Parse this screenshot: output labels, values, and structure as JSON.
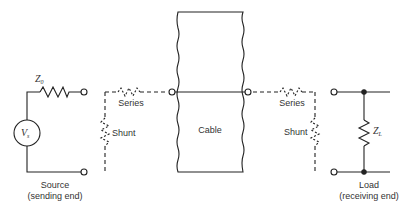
{
  "diagram": {
    "colors": {
      "line": "#222222",
      "text": "#333333",
      "background": "#ffffff"
    },
    "source": {
      "impedance_label": "Z",
      "impedance_subscript": "0",
      "voltage_label": "V",
      "voltage_subscript": "s",
      "caption_line1": "Source",
      "caption_line2": "(sending end)"
    },
    "left_network": {
      "series_label": "Series",
      "shunt_label": "Shunt"
    },
    "cable": {
      "label": "Cable"
    },
    "right_network": {
      "series_label": "Series",
      "shunt_label": "Shunt"
    },
    "load": {
      "impedance_label": "Z",
      "impedance_subscript": "L",
      "caption_line1": "Load",
      "caption_line2": "(receiving end)"
    }
  }
}
